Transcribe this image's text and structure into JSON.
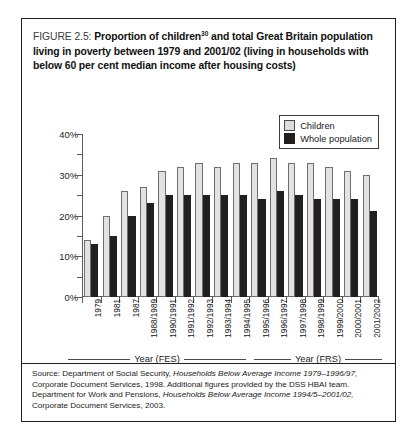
{
  "figure": {
    "label": "FIGURE 2.5:",
    "title_part1": "Proportion of children",
    "title_superscript": "30",
    "title_part2": " and total Great Britain population living in poverty between 1979 and 2001/02 (living in households with below 60 per cent median income after housing costs)"
  },
  "legend": {
    "items": [
      {
        "label": "Children",
        "color": "#dcdcdc"
      },
      {
        "label": "Whole population",
        "color": "#231f20"
      }
    ]
  },
  "axis_captions": {
    "left": "Year (FES)",
    "right": "Year (FRS)"
  },
  "source": {
    "line1_a": "Source: Department of Social Security, ",
    "line1_i": "Households Below Average Income 1979–1996/97,",
    "line2": " Corporate Document Services, 1998. Additional figures provided by the DSS HBAI team. Department for Work and Pensions, ",
    "line3_i": "Households Below Average Income 1994/5–2001/02,",
    "line4": " Corporate Document Services, 2003."
  },
  "chart_data": {
    "type": "bar",
    "xlabel": "Year (FES) / Year (FRS)",
    "ylabel": "",
    "ylim": [
      0,
      40
    ],
    "ytick_values": [
      0,
      10,
      20,
      30,
      40
    ],
    "ytick_labels": [
      "0%",
      "10%",
      "20%",
      "30%",
      "40%"
    ],
    "yminor_values": [
      5,
      15,
      25,
      35
    ],
    "grid": false,
    "legend_position": "top-right",
    "categories": [
      "1979",
      "1981",
      "1987",
      "1988/1989",
      "1990/1991",
      "1991/1992",
      "1992/1993",
      "1993/1994",
      "1994/1995",
      "1995/1996",
      "1996/1997",
      "1997/1998",
      "1998/1999",
      "1999/2000",
      "2000/2001",
      "2001/2002"
    ],
    "series": [
      {
        "name": "Children",
        "color": "#dcdcdc",
        "values": [
          14,
          20,
          26,
          27,
          31,
          32,
          33,
          32,
          33,
          33,
          34,
          33,
          33,
          32,
          31,
          30
        ]
      },
      {
        "name": "Whole population",
        "color": "#231f20",
        "values": [
          13,
          15,
          20,
          23,
          25,
          25,
          25,
          25,
          25,
          24,
          26,
          25,
          24,
          24,
          24,
          21
        ]
      }
    ]
  }
}
